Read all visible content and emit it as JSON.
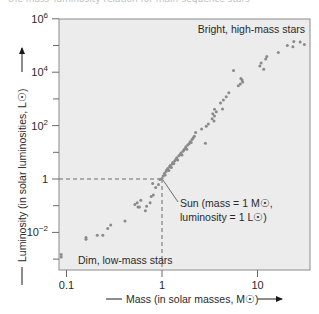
{
  "caption_fragment": "the mass–luminosity relation for main-sequence stars",
  "chart_data": {
    "type": "scatter",
    "title": "",
    "xlabel": "Mass (in solar masses, M☉)",
    "ylabel": "Luminosity (in solar luminosities, L☉)",
    "xscale": "log",
    "yscale": "log",
    "xlim": [
      0.085,
      36
    ],
    "ylim": [
      0.00035,
      1000000
    ],
    "x_ticks": [
      {
        "value": 0.1,
        "label": "0.1"
      },
      {
        "value": 1,
        "label": "1"
      },
      {
        "value": 10,
        "label": "10"
      }
    ],
    "y_ticks": [
      {
        "value": 1000000,
        "base": "10",
        "exp": "6"
      },
      {
        "value": 10000,
        "base": "10",
        "exp": "4"
      },
      {
        "value": 100,
        "base": "10",
        "exp": "2"
      },
      {
        "value": 1,
        "base": "1",
        "exp": ""
      },
      {
        "value": 0.01,
        "base": "10",
        "exp": "−2"
      }
    ],
    "y_minor_ticks": [
      100000,
      1000,
      10,
      0.1,
      0.001
    ],
    "grid": false,
    "legend": null,
    "background": "#ececec",
    "point_color": "#8a8a8a",
    "annotations": [
      {
        "text": "Bright, high-mass stars",
        "position": "top-right"
      },
      {
        "text": "Dim, low-mass stars",
        "position": "bottom-left"
      },
      {
        "text_line1": "Sun (mass = 1 M☉,",
        "text_line2": "luminosity = 1 L☉)",
        "x": 1,
        "y": 1
      }
    ],
    "reference_lines": [
      {
        "type": "dashed",
        "x": 1,
        "y": 1
      }
    ],
    "points": [
      [
        0.088,
        0.0012
      ],
      [
        0.088,
        0.0015
      ],
      [
        0.16,
        0.0055
      ],
      [
        0.16,
        0.0065
      ],
      [
        0.21,
        0.0078
      ],
      [
        0.24,
        0.0078
      ],
      [
        0.27,
        0.014
      ],
      [
        0.29,
        0.019
      ],
      [
        0.41,
        0.027
      ],
      [
        0.52,
        0.11
      ],
      [
        0.55,
        0.13
      ],
      [
        0.56,
        0.09
      ],
      [
        0.58,
        0.09
      ],
      [
        0.6,
        0.16
      ],
      [
        0.67,
        0.065
      ],
      [
        0.69,
        0.095
      ],
      [
        0.75,
        0.13
      ],
      [
        0.77,
        0.22
      ],
      [
        0.81,
        0.25
      ],
      [
        0.8,
        0.68
      ],
      [
        0.86,
        0.48
      ],
      [
        0.92,
        0.62
      ],
      [
        0.95,
        0.95
      ],
      [
        1.0,
        1.05
      ],
      [
        1.03,
        1.3
      ],
      [
        1.06,
        1.6
      ],
      [
        1.08,
        1.4
      ],
      [
        1.1,
        1.9
      ],
      [
        1.12,
        2.2
      ],
      [
        1.15,
        2.5
      ],
      [
        1.18,
        2.1
      ],
      [
        1.2,
        2.9
      ],
      [
        1.22,
        3.2
      ],
      [
        1.25,
        2.7
      ],
      [
        1.28,
        3.6
      ],
      [
        1.3,
        4.2
      ],
      [
        1.33,
        3.8
      ],
      [
        1.36,
        4.8
      ],
      [
        1.4,
        5.5
      ],
      [
        1.43,
        6.2
      ],
      [
        1.46,
        5.2
      ],
      [
        1.5,
        7.4
      ],
      [
        1.55,
        8.3
      ],
      [
        1.58,
        9.5
      ],
      [
        1.62,
        8.0
      ],
      [
        1.66,
        11
      ],
      [
        1.7,
        12.5
      ],
      [
        1.75,
        14
      ],
      [
        1.78,
        16
      ],
      [
        1.82,
        13
      ],
      [
        1.86,
        19
      ],
      [
        1.92,
        21
      ],
      [
        1.97,
        25
      ],
      [
        2.02,
        23
      ],
      [
        2.06,
        30
      ],
      [
        2.12,
        34
      ],
      [
        2.18,
        40
      ],
      [
        2.25,
        55
      ],
      [
        2.6,
        75
      ],
      [
        2.9,
        95
      ],
      [
        3.05,
        115
      ],
      [
        2.85,
        22
      ],
      [
        3.5,
        150
      ],
      [
        3.35,
        180
      ],
      [
        3.55,
        230
      ],
      [
        3.4,
        280
      ],
      [
        3.7,
        330
      ],
      [
        3.55,
        410
      ],
      [
        4.3,
        420
      ],
      [
        4.1,
        700
      ],
      [
        4.4,
        900
      ],
      [
        4.7,
        1200
      ],
      [
        5.0,
        1700
      ],
      [
        6.3,
        3100
      ],
      [
        6.6,
        3600
      ],
      [
        6.9,
        5100
      ],
      [
        6.7,
        5800
      ],
      [
        7.0,
        4300
      ],
      [
        5.6,
        11500
      ],
      [
        10.6,
        17000
      ],
      [
        10.9,
        22000
      ],
      [
        11.6,
        13000
      ],
      [
        12.5,
        39000
      ],
      [
        12.2,
        31000
      ],
      [
        16.5,
        55000
      ],
      [
        20.5,
        100000
      ],
      [
        24,
        140000
      ],
      [
        23.5,
        90000
      ],
      [
        28,
        135000
      ],
      [
        31,
        110000
      ]
    ]
  }
}
